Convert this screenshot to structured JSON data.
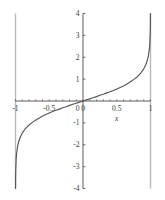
{
  "chart_data": {
    "type": "line",
    "title": "",
    "subtitle": "",
    "xlabel": "x",
    "ylabel": "",
    "xlim": [
      -1,
      1
    ],
    "ylim": [
      -4,
      4
    ],
    "grid": false,
    "legend": null,
    "legend_position": "none",
    "curve_color": "#555555",
    "asymptote_color": "#b9b9b9",
    "axis_color": "#4a4a4a",
    "background": "#ffffff",
    "asymptotes": {
      "vertical": [
        -1,
        1
      ]
    },
    "xticks": [
      -1,
      -0.5,
      0,
      0.5,
      1
    ],
    "xtick_labels": [
      "-1",
      "-0.5",
      "0",
      "0.5",
      "1"
    ],
    "xminor_step": 0.1,
    "yticks": [
      -4,
      -3,
      -2,
      -1,
      0,
      1,
      2,
      3,
      4
    ],
    "ytick_labels": [
      "-4",
      "-3",
      "-2",
      "-1",
      "0",
      "1",
      "2",
      "3",
      "4"
    ],
    "series": [
      {
        "name": "arctanh",
        "x": [
          -0.9993,
          -0.999,
          -0.998,
          -0.996,
          -0.993,
          -0.99,
          -0.985,
          -0.98,
          -0.97,
          -0.96,
          -0.95,
          -0.93,
          -0.91,
          -0.89,
          -0.86,
          -0.83,
          -0.8,
          -0.76,
          -0.72,
          -0.68,
          -0.64,
          -0.6,
          -0.55,
          -0.5,
          -0.45,
          -0.4,
          -0.35,
          -0.3,
          -0.25,
          -0.2,
          -0.15,
          -0.1,
          -0.05,
          0,
          0.05,
          0.1,
          0.15,
          0.2,
          0.25,
          0.3,
          0.35,
          0.4,
          0.45,
          0.5,
          0.55,
          0.6,
          0.64,
          0.68,
          0.72,
          0.76,
          0.8,
          0.83,
          0.86,
          0.89,
          0.91,
          0.93,
          0.95,
          0.96,
          0.97,
          0.98,
          0.985,
          0.99,
          0.993,
          0.996,
          0.998,
          0.999,
          0.9993
        ],
        "y": [
          -4.0,
          -3.8,
          -3.45,
          -3.1,
          -2.92,
          -2.65,
          -2.44,
          -2.3,
          -2.09,
          -1.95,
          -1.83,
          -1.66,
          -1.53,
          -1.42,
          -1.29,
          -1.19,
          -1.1,
          -1.0,
          -0.91,
          -0.83,
          -0.76,
          -0.69,
          -0.62,
          -0.55,
          -0.48,
          -0.42,
          -0.37,
          -0.31,
          -0.26,
          -0.2,
          -0.15,
          -0.1,
          -0.05,
          0,
          0.05,
          0.1,
          0.15,
          0.2,
          0.26,
          0.31,
          0.37,
          0.42,
          0.48,
          0.55,
          0.62,
          0.69,
          0.76,
          0.83,
          0.91,
          1.0,
          1.1,
          1.19,
          1.29,
          1.42,
          1.53,
          1.66,
          1.83,
          1.95,
          2.09,
          2.3,
          2.44,
          2.65,
          2.92,
          3.1,
          3.45,
          3.8,
          4.0
        ]
      }
    ]
  }
}
